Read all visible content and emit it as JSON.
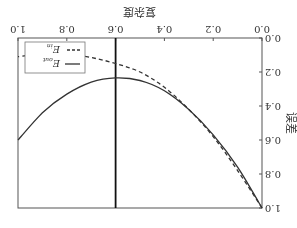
{
  "chart_data": {
    "type": "line",
    "title": "",
    "xlabel": "复杂度",
    "ylabel": "误差",
    "xlim": [
      0.0,
      1.0
    ],
    "ylim": [
      0.0,
      1.0
    ],
    "xticks": [
      "0.0",
      "0.2",
      "0.4",
      "0.6",
      "0.8",
      "1.0"
    ],
    "yticks": [
      "0.0",
      "0.2",
      "0.4",
      "0.6",
      "0.8",
      "1.0"
    ],
    "grid": false,
    "legend_position": "upper right",
    "orientation_note": "image rendered rotated 180 degrees",
    "vertical_line": {
      "x": 0.6,
      "label": ""
    },
    "series": [
      {
        "name": "E_out",
        "style": "solid",
        "x": [
          0.0,
          0.1,
          0.2,
          0.3,
          0.4,
          0.5,
          0.6,
          0.7,
          0.8,
          0.9,
          1.0
        ],
        "y": [
          1.0,
          0.76,
          0.57,
          0.42,
          0.31,
          0.25,
          0.235,
          0.26,
          0.33,
          0.44,
          0.6
        ]
      },
      {
        "name": "E_in",
        "style": "dashed",
        "x": [
          0.0,
          0.1,
          0.2,
          0.3,
          0.4,
          0.5,
          0.6,
          0.7,
          0.8,
          0.9,
          1.0
        ],
        "y": [
          1.0,
          0.78,
          0.58,
          0.42,
          0.29,
          0.2,
          0.15,
          0.115,
          0.095,
          0.095,
          0.11
        ]
      }
    ]
  },
  "legend": {
    "items": [
      {
        "label": "E_out",
        "sub": "out"
      },
      {
        "label": "E_in",
        "sub": "in"
      }
    ]
  }
}
